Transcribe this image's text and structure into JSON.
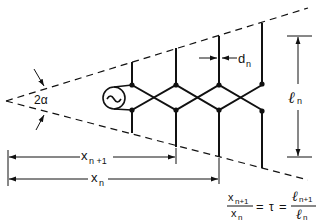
{
  "diagram": {
    "colors": {
      "ink": "#111111",
      "background": "#ffffff"
    },
    "labels": {
      "angle": "2α",
      "spacing": "d",
      "spacing_sub": "n",
      "length": "ℓ",
      "length_sub": "n",
      "x_n1": "x",
      "x_n1_sub": "n +1",
      "x_n": "x",
      "x_n_sub": "n"
    },
    "formula": {
      "num_left": "x",
      "num_left_sub": "n+1",
      "den_left": "x",
      "den_left_sub": "n",
      "equals1": "=",
      "tau": "τ",
      "equals2": "=",
      "num_right": "ℓ",
      "num_right_sub": "n+1",
      "den_right": "ℓ",
      "den_right_sub": "n"
    },
    "source_icon": "ac-source-icon",
    "dipoles": [
      {
        "x": 132,
        "top": 62,
        "node_top": 85,
        "node_bot": 110,
        "bottom": 133
      },
      {
        "x": 176,
        "top": 48,
        "node_top": 85,
        "node_bot": 110,
        "bottom": 147
      },
      {
        "x": 219,
        "top": 36,
        "node_top": 85,
        "node_bot": 110,
        "bottom": 157
      },
      {
        "x": 262,
        "top": 23,
        "node_top": 85,
        "node_bot": 110,
        "bottom": 168
      }
    ]
  }
}
